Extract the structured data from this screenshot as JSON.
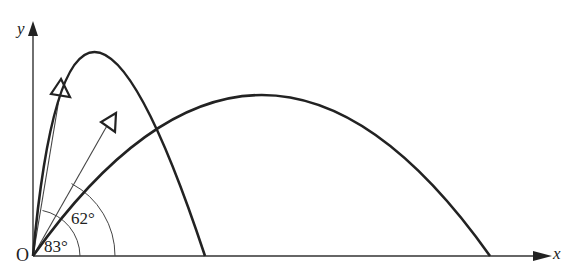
{
  "diagram": {
    "title": "",
    "axes": {
      "x_label": "x",
      "y_label": "y",
      "origin_label": "O"
    },
    "angles": [
      {
        "label": "83°",
        "degrees": 83
      },
      {
        "label": "62°",
        "degrees": 62
      }
    ],
    "trajectories": [
      {
        "name": "steep-trajectory",
        "launch_angle": 83
      },
      {
        "name": "shallow-trajectory",
        "launch_angle": 62
      }
    ],
    "colors": {
      "stroke": "#222222",
      "background": "#ffffff"
    }
  }
}
